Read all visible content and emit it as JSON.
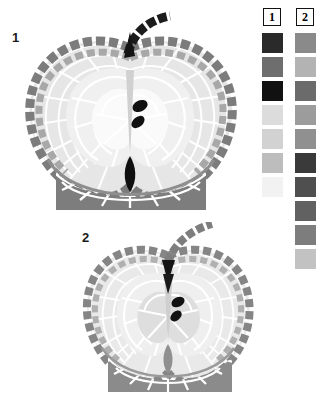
{
  "page": {
    "background": "#ffffff",
    "width": 321,
    "height": 406
  },
  "figures": [
    {
      "label": "1",
      "name": "apple-cross-section-figure-1",
      "description": "mosaic apple cut in half, stem up-right, two black seeds, dark base"
    },
    {
      "label": "2",
      "name": "apple-cross-section-figure-2",
      "description": "mosaic apple cut in half, stem up-right, two black seeds, dark base"
    }
  ],
  "legend": {
    "columns": [
      {
        "header": "1",
        "name": "legend-column-1",
        "swatches": [
          {
            "name": "swatch-1-1",
            "color": "#2a2a2a"
          },
          {
            "name": "swatch-1-2",
            "color": "#6e6e6e"
          },
          {
            "name": "swatch-1-3",
            "color": "#111111"
          },
          {
            "name": "swatch-1-4",
            "color": "#dcdcdc"
          },
          {
            "name": "swatch-1-5",
            "color": "#d2d2d2"
          },
          {
            "name": "swatch-1-6",
            "color": "#bdbdbd"
          },
          {
            "name": "swatch-1-7",
            "color": "#f2f2f2"
          }
        ]
      },
      {
        "header": "2",
        "name": "legend-column-2",
        "swatches": [
          {
            "name": "swatch-2-1",
            "color": "#8a8a8a"
          },
          {
            "name": "swatch-2-2",
            "color": "#b3b3b3"
          },
          {
            "name": "swatch-2-3",
            "color": "#6b6b6b"
          },
          {
            "name": "swatch-2-4",
            "color": "#9c9c9c"
          },
          {
            "name": "swatch-2-5",
            "color": "#909090"
          },
          {
            "name": "swatch-2-6",
            "color": "#3a3a3a"
          },
          {
            "name": "swatch-2-7",
            "color": "#4f4f4f"
          },
          {
            "name": "swatch-2-8",
            "color": "#616161"
          },
          {
            "name": "swatch-2-9",
            "color": "#7d7d7d"
          },
          {
            "name": "swatch-2-10",
            "color": "#c2c2c2"
          }
        ]
      }
    ]
  },
  "palette": {
    "outline_dark": "#7a7a7a",
    "outline_mid": "#9a9a9a",
    "flesh_light": "#e8e8e8",
    "flesh_lighter": "#f1f1f1",
    "flesh_pale": "#f7f7f7",
    "core_mid": "#d6d6d6",
    "base_dark": "#808080",
    "base_darker": "#6a6a6a",
    "seed_black": "#101010",
    "stem_black": "#1a1a1a",
    "grout": "#ffffff"
  }
}
